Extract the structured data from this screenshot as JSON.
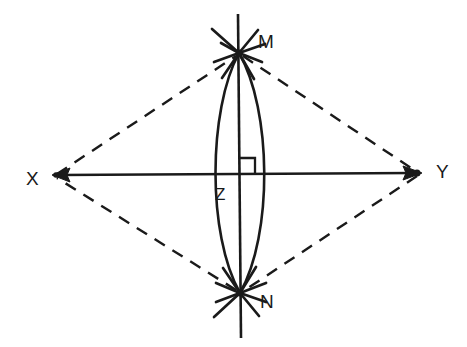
{
  "diagram": {
    "type": "geometric-construction",
    "background_color": "#ffffff",
    "stroke_color": "#1a1a1a",
    "labels": {
      "x": "X",
      "y": "Y",
      "m": "M",
      "n": "N",
      "z": "Z"
    },
    "points": {
      "X": {
        "name": "X",
        "x": 53,
        "y": 175,
        "marker": "arrowhead-left"
      },
      "Y": {
        "name": "Y",
        "x": 420,
        "y": 173,
        "marker": "arrowhead-right"
      },
      "M": {
        "name": "M",
        "x": 239,
        "y": 53,
        "marker": "arc-intersection"
      },
      "N": {
        "name": "N",
        "x": 240,
        "y": 293,
        "marker": "arc-intersection"
      },
      "Z": {
        "name": "Z",
        "x": 238,
        "y": 175,
        "marker": "intersection"
      }
    },
    "label_positions": {
      "X": {
        "x": 26,
        "y": 180
      },
      "Y": {
        "x": 436,
        "y": 173
      },
      "M": {
        "x": 258,
        "y": 43
      },
      "N": {
        "x": 260,
        "y": 303
      },
      "Z": {
        "x": 215,
        "y": 196
      }
    },
    "segments": [
      {
        "name": "line-xy",
        "style": "solid",
        "from": "X",
        "to": "Y",
        "arrows": "both"
      },
      {
        "name": "line-mn",
        "style": "solid",
        "from": "M-extended",
        "to": "N-extended",
        "arrows": "none"
      },
      {
        "name": "dashed-xm",
        "style": "dashed",
        "from": "X",
        "to": "M"
      },
      {
        "name": "dashed-my",
        "style": "dashed",
        "from": "M",
        "to": "Y"
      },
      {
        "name": "dashed-yn",
        "style": "dashed",
        "from": "Y",
        "to": "N"
      },
      {
        "name": "dashed-nx",
        "style": "dashed",
        "from": "N",
        "to": "X"
      }
    ],
    "arcs": {
      "name": "compass-arcs-vesica",
      "description": "Two intersecting compass arcs centered at X and Y forming a lens",
      "left_extent": 211,
      "right_extent": 272,
      "top": 53,
      "bottom": 293
    },
    "right_angle_mark": {
      "name": "right-angle-at-z",
      "x": 238,
      "y": 175,
      "size": 17,
      "quadrant": "upper-right",
      "angle_degrees": 90
    }
  }
}
